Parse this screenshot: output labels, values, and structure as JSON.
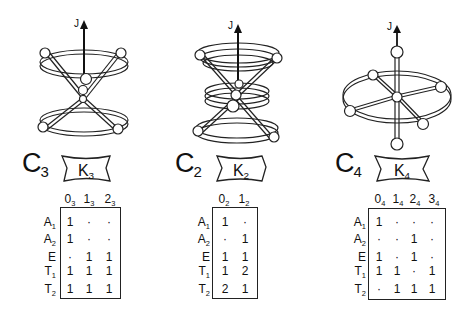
{
  "figure": {
    "axis_label": "J",
    "panels": [
      {
        "id": "c3",
        "group_label": "C",
        "group_sub": "3",
        "k_label": "K",
        "k_sub": "3",
        "columns": [
          {
            "main": "0",
            "sub": "3"
          },
          {
            "main": "1",
            "sub": "3"
          },
          {
            "main": "2",
            "sub": "3"
          }
        ],
        "rows": [
          {
            "label": "A",
            "sub": "1",
            "values": [
              "1",
              "·",
              "·"
            ]
          },
          {
            "label": "A",
            "sub": "2",
            "values": [
              "1",
              "·",
              "·"
            ]
          },
          {
            "label": "E",
            "sub": "",
            "values": [
              "·",
              "1",
              "1"
            ]
          },
          {
            "label": "T",
            "sub": "1",
            "values": [
              "1",
              "1",
              "1"
            ]
          },
          {
            "label": "T",
            "sub": "2",
            "values": [
              "1",
              "1",
              "1"
            ]
          }
        ]
      },
      {
        "id": "c2",
        "group_label": "C",
        "group_sub": "2",
        "k_label": "K",
        "k_sub": "2",
        "columns": [
          {
            "main": "0",
            "sub": "2"
          },
          {
            "main": "1",
            "sub": "2"
          }
        ],
        "rows": [
          {
            "label": "A",
            "sub": "1",
            "values": [
              "1",
              "·"
            ]
          },
          {
            "label": "A",
            "sub": "2",
            "values": [
              "·",
              "1"
            ]
          },
          {
            "label": "E",
            "sub": "",
            "values": [
              "1",
              "1"
            ]
          },
          {
            "label": "T",
            "sub": "1",
            "values": [
              "1",
              "2"
            ]
          },
          {
            "label": "T",
            "sub": "2",
            "values": [
              "2",
              "1"
            ]
          }
        ]
      },
      {
        "id": "c4",
        "group_label": "C",
        "group_sub": "4",
        "k_label": "K",
        "k_sub": "4",
        "columns": [
          {
            "main": "0",
            "sub": "4"
          },
          {
            "main": "1",
            "sub": "4"
          },
          {
            "main": "2",
            "sub": "4"
          },
          {
            "main": "3",
            "sub": "4"
          }
        ],
        "rows": [
          {
            "label": "A",
            "sub": "1",
            "values": [
              "1",
              "·",
              "·",
              "·"
            ]
          },
          {
            "label": "A",
            "sub": "2",
            "values": [
              "·",
              "·",
              "1",
              "·"
            ]
          },
          {
            "label": "E",
            "sub": "",
            "values": [
              "1",
              "·",
              "1",
              "·"
            ]
          },
          {
            "label": "T",
            "sub": "1",
            "values": [
              "1",
              "1",
              "·",
              "1"
            ]
          },
          {
            "label": "T",
            "sub": "2",
            "values": [
              "·",
              "1",
              "1",
              "1"
            ]
          }
        ]
      }
    ]
  }
}
